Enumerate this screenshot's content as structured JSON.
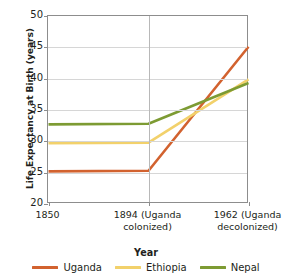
{
  "chart_data": {
    "type": "line",
    "title": "",
    "xlabel": "Year",
    "ylabel": "Life Expectancy at Birth (years)",
    "categories": [
      "1850",
      "1894 (Uganda colonized)",
      "1962 (Uganda decolonized)"
    ],
    "category_lines": [
      [
        "1850"
      ],
      [
        "1894 (Uganda",
        "colonized)"
      ],
      [
        "1962 (Uganda",
        "decolonized)"
      ]
    ],
    "series": [
      {
        "name": "Uganda",
        "color": "#d2622f",
        "values": [
          25.2,
          25.3,
          45.1
        ]
      },
      {
        "name": "Ethiopia",
        "color": "#f2d16b",
        "values": [
          29.7,
          29.8,
          39.9
        ]
      },
      {
        "name": "Nepal",
        "color": "#7d9b33",
        "values": [
          32.7,
          32.8,
          39.3
        ]
      }
    ],
    "ylim": [
      20,
      50
    ],
    "yticks": [
      50,
      45,
      40,
      35,
      30,
      25,
      20
    ],
    "ytick_labels": [
      "50",
      "45",
      "40",
      "35",
      "30",
      "25",
      "20"
    ],
    "grid": {
      "horizontal": true,
      "vertical": true
    },
    "legend_position": "bottom"
  },
  "legend": {
    "items": [
      {
        "label": "Uganda"
      },
      {
        "label": "Ethiopia"
      },
      {
        "label": "Nepal"
      }
    ]
  },
  "axis": {
    "y_title": "Life Expectancy at Birth (years)",
    "x_title": "Year"
  }
}
